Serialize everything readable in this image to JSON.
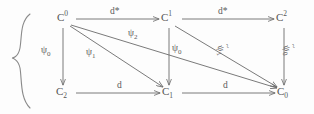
{
  "figure": {
    "type": "commutative-diagram",
    "stroke_color": "#6b6b6b",
    "text_color": "#555555",
    "background_color": "#fdfdfd"
  },
  "nodes": [
    {
      "id": "C0-top",
      "base": "C",
      "script": "0",
      "script_kind": "superscript",
      "x": 62,
      "y": 22
    },
    {
      "id": "C1-top",
      "base": "C",
      "script": "1",
      "script_kind": "superscript",
      "x": 166,
      "y": 22
    },
    {
      "id": "C2-top",
      "base": "C",
      "script": "2",
      "script_kind": "superscript",
      "x": 281,
      "y": 22
    },
    {
      "id": "C2-bottom",
      "base": "C",
      "script": "2",
      "script_kind": "subscript",
      "x": 61,
      "y": 96
    },
    {
      "id": "C1-bottom",
      "base": "C",
      "script": "1",
      "script_kind": "subscript",
      "x": 167,
      "y": 96
    },
    {
      "id": "C0-bottom",
      "base": "C",
      "script": "0",
      "script_kind": "subscript",
      "x": 282,
      "y": 96
    }
  ],
  "edges": [
    {
      "id": "e-top-1",
      "from": "C0-top",
      "to": "C1-top",
      "label": "d*",
      "label_kind": "plain",
      "direction": "right"
    },
    {
      "id": "e-top-2",
      "from": "C1-top",
      "to": "C2-top",
      "label": "d*",
      "label_kind": "plain",
      "direction": "right"
    },
    {
      "id": "e-bottom-1",
      "from": "C2-bottom",
      "to": "C1-bottom",
      "label": "d",
      "label_kind": "plain",
      "direction": "right"
    },
    {
      "id": "e-bottom-2",
      "from": "C1-bottom",
      "to": "C0-bottom",
      "label": "d",
      "label_kind": "plain",
      "direction": "right"
    },
    {
      "id": "e-vert-left",
      "from": "C0-top",
      "to": "C2-bottom",
      "label_base": "ψ",
      "label_sub": "0",
      "label_kind": "psi",
      "direction": "down"
    },
    {
      "id": "e-vert-mid",
      "from": "C1-top",
      "to": "C1-bottom",
      "label_base": "ψ",
      "label_sub": "0",
      "label_kind": "psi",
      "direction": "down"
    },
    {
      "id": "e-vert-right",
      "from": "C2-top",
      "to": "C0-bottom",
      "label_base": "ψ",
      "label_sub": "0",
      "label_kind": "psi-tilde",
      "direction": "down"
    },
    {
      "id": "e-diag-1",
      "from": "C0-top",
      "to": "C1-bottom",
      "label_base": "ψ",
      "label_sub": "1",
      "label_kind": "psi",
      "direction": "diagonal-down-right"
    },
    {
      "id": "e-diag-2",
      "from": "C0-top",
      "to": "C0-bottom",
      "label_base": "ψ",
      "label_sub": "2",
      "label_kind": "psi",
      "direction": "diagonal-down-right"
    },
    {
      "id": "e-diag-3",
      "from": "C1-top",
      "to": "C0-bottom",
      "label_base": "ψ",
      "label_sub": "1",
      "label_kind": "psi-tilde",
      "direction": "diagonal-down-right"
    }
  ],
  "edge_labels": {
    "d_star_top_left": "d*",
    "d_star_top_right": "d*",
    "d_bottom_left": "d",
    "d_bottom_right": "d",
    "psi_base": "ψ",
    "tilde": "~",
    "sub_0": "0",
    "sub_1": "1",
    "sub_2": "2"
  },
  "decorations": {
    "left_brace": {
      "name": "curly-brace",
      "visible": true
    }
  }
}
